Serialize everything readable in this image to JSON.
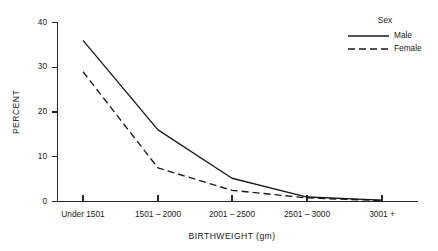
{
  "chart_data": {
    "type": "line",
    "title": "",
    "xlabel": "BIRTHWEIGHT (gm)",
    "ylabel": "PERCENT",
    "categories": [
      "Under 1501",
      "1501 – 2000",
      "2001 – 2500",
      "2501 – 3000",
      "3001 +"
    ],
    "series": [
      {
        "name": "Male",
        "style": "solid",
        "values": [
          36.0,
          16.0,
          5.2,
          1.0,
          0.3
        ]
      },
      {
        "name": "Female",
        "style": "dashed",
        "values": [
          29.0,
          7.5,
          2.5,
          0.8,
          0.2
        ]
      }
    ],
    "ylim": [
      0,
      40
    ],
    "yticks": [
      0,
      10,
      20,
      30,
      40
    ],
    "ytick_labels": [
      "0",
      "10",
      "20",
      "30",
      "40"
    ],
    "grid": false,
    "legend": {
      "title": "Sex",
      "position": "top-right",
      "entries": [
        "Male",
        "Female"
      ]
    }
  },
  "axes": {
    "y_title": "PERCENT",
    "x_title": "BIRTHWEIGHT (gm)",
    "y_tick_0": "0",
    "y_tick_1": "10",
    "y_tick_2": "20",
    "y_tick_3": "30",
    "y_tick_4": "40",
    "x_tick_0": "Under 1501",
    "x_tick_1": "1501 – 2000",
    "x_tick_2": "2001 – 2500",
    "x_tick_3": "2501 – 3000",
    "x_tick_4": "3001 +"
  },
  "legend": {
    "title": "Sex",
    "entry_male": "Male",
    "entry_female": "Female"
  },
  "colors": {
    "ink": "#1a1a1a",
    "background": "#ffffff"
  }
}
